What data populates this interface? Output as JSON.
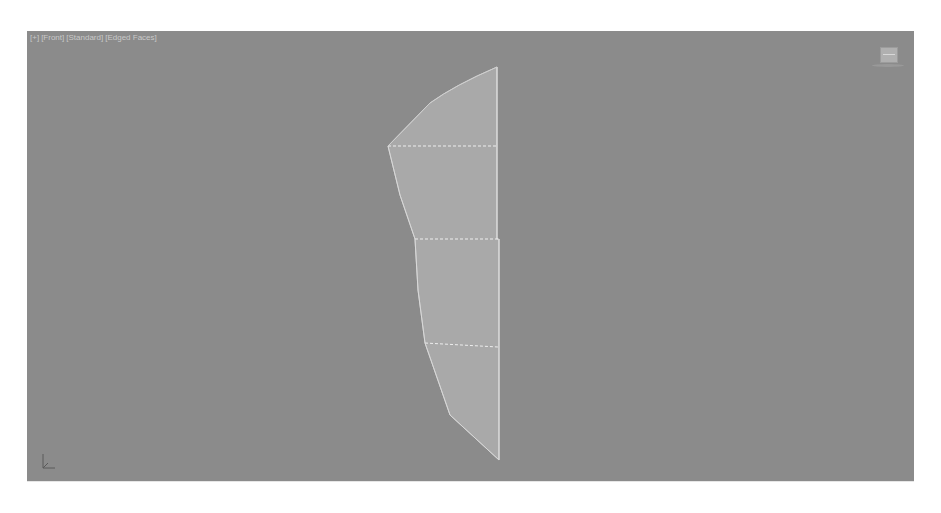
{
  "viewport": {
    "label_segments": [
      "[+]",
      "[Front]",
      "[Standard]",
      "[Edged Faces]"
    ],
    "background_color": "#8b8b8b",
    "object_fill_color": "#a9a9a9",
    "edge_color": "#e8e8e8"
  },
  "icons": {
    "viewcube": "viewcube-icon",
    "axis": "axis-tripod-icon"
  }
}
